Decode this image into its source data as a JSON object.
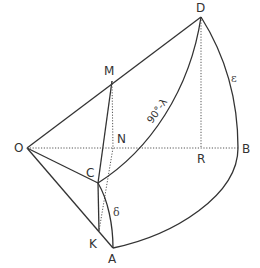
{
  "diagram": {
    "type": "spherical-geometry-construction",
    "points": {
      "O": {
        "label": "O",
        "x": 27,
        "y": 148
      },
      "D": {
        "label": "D",
        "x": 201,
        "y": 17
      },
      "M": {
        "label": "M",
        "x": 112,
        "y": 81
      },
      "N": {
        "label": "N",
        "x": 113,
        "y": 148
      },
      "R": {
        "label": "R",
        "x": 201,
        "y": 148
      },
      "B": {
        "label": "B",
        "x": 238,
        "y": 148
      },
      "C": {
        "label": "C",
        "x": 98,
        "y": 183
      },
      "K": {
        "label": "K",
        "x": 99,
        "y": 231
      },
      "A": {
        "label": "A",
        "x": 113,
        "y": 248
      }
    },
    "arc_labels": {
      "complement_latitude": "90°-λ",
      "delta": "δ",
      "epsilon": "ε"
    },
    "colors": {
      "stroke": "#333333",
      "background": "#ffffff"
    }
  }
}
